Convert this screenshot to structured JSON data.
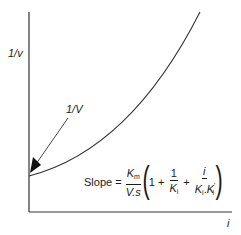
{
  "diagram": {
    "type": "enzyme kinetics plot (reciprocal velocity vs inhibitor concentration)",
    "y_axis": {
      "label": "1/v"
    },
    "x_axis": {
      "label": "i"
    },
    "intercept_label": "1/V",
    "curve": "upward-curving (parabolic) line starting at y-intercept 1/V",
    "formula": {
      "prefix": "Slope =",
      "frac1_num": "K",
      "frac1_num_sub": "m",
      "frac1_den": "V.s",
      "one": "1",
      "plus1": "+",
      "frac2_num": "1",
      "frac2_den": "K",
      "frac2_den_sub": "i",
      "plus2": "+",
      "frac3_num": "i",
      "frac3_den_a": "K",
      "frac3_den_a_sub": "i",
      "frac3_den_dot": ".",
      "frac3_den_b": "K",
      "frac3_den_b_sub": "i",
      "frac3_den_b_sup": "'"
    },
    "colors": {
      "ink": "#1a1a1a",
      "background": "#ffffff"
    }
  }
}
